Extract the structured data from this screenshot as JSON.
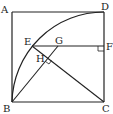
{
  "diagram": {
    "type": "geometry",
    "colors": {
      "stroke": "#222222",
      "background": "#ffffff"
    },
    "points": {
      "A": {
        "label": "A",
        "x": 12,
        "y": 12,
        "lx": 1,
        "ly": 13
      },
      "B": {
        "label": "B",
        "x": 12,
        "y": 102,
        "lx": 3,
        "ly": 112
      },
      "C": {
        "label": "C",
        "x": 104,
        "y": 102,
        "lx": 102,
        "ly": 112
      },
      "D": {
        "label": "D",
        "x": 104,
        "y": 12,
        "lx": 101,
        "ly": 10
      },
      "E": {
        "label": "E",
        "x": 32,
        "y": 46,
        "lx": 24,
        "ly": 45
      },
      "F": {
        "label": "F",
        "x": 104,
        "y": 46,
        "lx": 106,
        "ly": 50
      },
      "G": {
        "label": "G",
        "x": 58,
        "y": 46,
        "lx": 55,
        "ly": 44
      },
      "H": {
        "label": "H",
        "x": 48,
        "y": 58,
        "lx": 36,
        "ly": 62
      }
    },
    "segments": [
      "AB",
      "BC",
      "CD",
      "DA",
      "EF",
      "EC",
      "BG"
    ],
    "arc": {
      "center": "C",
      "from": "B",
      "to": "D",
      "radius": 92
    },
    "right_angles": [
      "F",
      "H"
    ]
  }
}
